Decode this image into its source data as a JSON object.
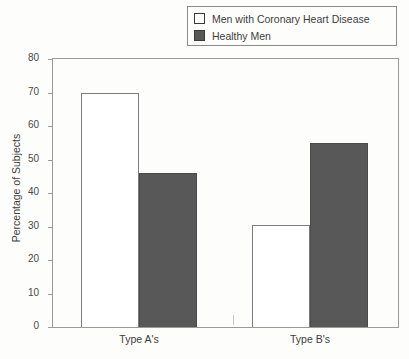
{
  "chart_data": {
    "type": "bar",
    "title": "",
    "xlabel": "",
    "ylabel": "Percentage of Subjects",
    "categories": [
      "Type A's",
      "Type B's"
    ],
    "series": [
      {
        "name": "Men with Coronary Heart Disease",
        "style": "open",
        "color": "#ffffff",
        "values": [
          70,
          30.5
        ]
      },
      {
        "name": "Healthy Men",
        "style": "filled",
        "color": "#585858",
        "values": [
          46,
          55
        ]
      }
    ],
    "ylim": [
      0,
      80
    ],
    "yticks": [
      0,
      10,
      20,
      30,
      40,
      50,
      60,
      70,
      80
    ],
    "ytick_labels": [
      "0",
      "10",
      "20",
      "30",
      "40",
      "50",
      "60",
      "70",
      "80"
    ],
    "grid": false,
    "legend_position": "top-right"
  },
  "legend": {
    "entries": [
      {
        "label": "Men with Coronary Heart Disease",
        "swatch": "open-square-swatch"
      },
      {
        "label": "Healthy Men",
        "swatch": "filled-square-swatch"
      }
    ]
  },
  "axes": {
    "y_title": "Percentage of Subjects",
    "y_tick_labels": [
      "80",
      "70",
      "60",
      "50",
      "40",
      "30",
      "20",
      "10",
      "0"
    ],
    "x_tick_labels": [
      "Type A's",
      "Type B's"
    ]
  },
  "colors": {
    "bar_open_fill": "#ffffff",
    "bar_filled_fill": "#585858",
    "axis_line": "#9a9a9a",
    "text": "#3d3d3d",
    "background": "#fdfdfb"
  }
}
